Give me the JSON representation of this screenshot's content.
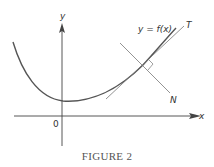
{
  "figure": {
    "caption": "FIGURE 2",
    "curve_label": "y = f(x)",
    "tangent_label": "T",
    "normal_label": "N",
    "x_axis_label": "x",
    "y_axis_label": "y",
    "origin_label": "0"
  },
  "colors": {
    "curve": "#555555",
    "lines": "#777777",
    "axes": "#444444",
    "text": "#333333"
  }
}
